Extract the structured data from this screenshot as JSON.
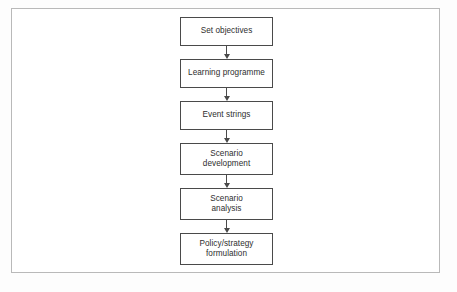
{
  "figure": {
    "type": "flowchart",
    "orientation": "vertical-top-down",
    "frame_border_color": "#b9b9b9",
    "node_border_color": "#4a4a4a",
    "node_fill_color": "#ffffff",
    "text_color": "#2e2e2e",
    "background_color": "#fdfdfd"
  },
  "nodes": [
    {
      "id": "set-objectives",
      "lines": [
        "Set objectives"
      ],
      "text": "Set objectives"
    },
    {
      "id": "learning-programme",
      "lines": [
        "Learning programme"
      ],
      "text": "Learning programme"
    },
    {
      "id": "event-strings",
      "lines": [
        "Event strings"
      ],
      "text": "Event strings"
    },
    {
      "id": "scenario-development",
      "lines": [
        "Scenario",
        "development"
      ],
      "text": "Scenario development"
    },
    {
      "id": "scenario-analysis",
      "lines": [
        "Scenario",
        "analysis"
      ],
      "text": "Scenario analysis"
    },
    {
      "id": "policy-formulation",
      "lines": [
        "Policy/strategy",
        "formulation"
      ],
      "text": "Policy/strategy formulation"
    }
  ],
  "connectors": [
    {
      "from": "set-objectives",
      "to": "learning-programme",
      "arrow": "down"
    },
    {
      "from": "learning-programme",
      "to": "event-strings",
      "arrow": "down"
    },
    {
      "from": "event-strings",
      "to": "scenario-development",
      "arrow": "down"
    },
    {
      "from": "scenario-development",
      "to": "scenario-analysis",
      "arrow": "down"
    },
    {
      "from": "scenario-analysis",
      "to": "policy-formulation",
      "arrow": "down"
    }
  ]
}
